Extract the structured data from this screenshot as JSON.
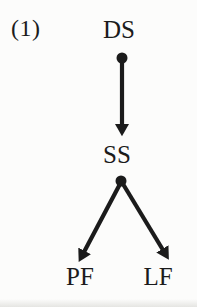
{
  "figure": {
    "label": "(1)",
    "ink_color": "#1b1b1b",
    "background_color": "#fcfcfb"
  },
  "diagram": {
    "type": "tree",
    "nodes": [
      {
        "id": "ds",
        "label": "DS"
      },
      {
        "id": "ss",
        "label": "SS"
      },
      {
        "id": "pf",
        "label": "PF"
      },
      {
        "id": "lf",
        "label": "LF"
      }
    ],
    "edges": [
      {
        "from": "DS",
        "to": "SS",
        "connector": "dot-origin-arrow"
      },
      {
        "from": "SS",
        "to": "PF",
        "connector": "dot-origin-arrow"
      },
      {
        "from": "SS",
        "to": "LF",
        "connector": "dot-origin-arrow"
      }
    ]
  }
}
